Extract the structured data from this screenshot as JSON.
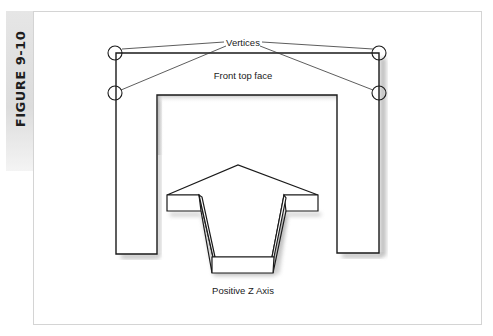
{
  "figure": {
    "label": "FIGURE 9-10"
  },
  "diagram": {
    "labels": {
      "vertices": "Vertices",
      "front_top_face": "Front top face",
      "positive_z_axis": "Positive Z Axis"
    },
    "colors": {
      "stroke": "#1a1a1a",
      "leader": "#333333",
      "shadow": "#8a8a8a",
      "frame_border": "#d4d4d4",
      "tab_bg": "#dcdcdc"
    }
  }
}
